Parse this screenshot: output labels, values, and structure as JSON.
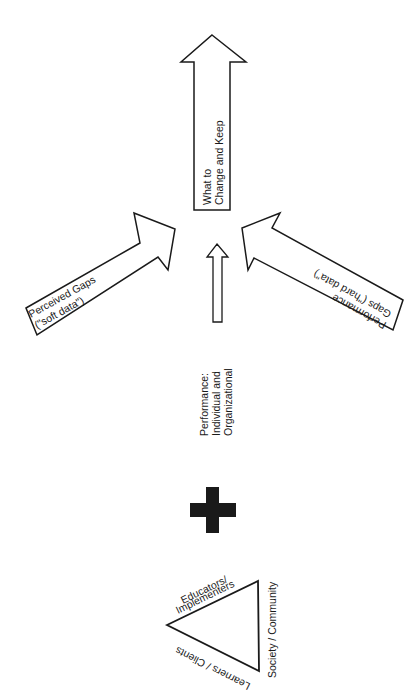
{
  "diagram": {
    "top_arrow": {
      "line1": "What to",
      "line2": "Change and Keep"
    },
    "left_arrow": {
      "line1": "Perceived Gaps",
      "line2": "(\"soft data\")"
    },
    "right_arrow": {
      "line1": "Performance",
      "line2": "Gaps (\"hard data\")"
    },
    "center_label": {
      "line1": "Performance:",
      "line2": "Individual  and",
      "line3": "Organizational"
    },
    "plus_symbol": "+",
    "triangle": {
      "top_side_line1": "Educators/",
      "top_side_line2": "Implementers",
      "right_side": "Society / Community",
      "bottom_side": "Learners / Clients"
    }
  },
  "colors": {
    "stroke": "#1a1a1a",
    "fill": "#ffffff",
    "plus": "#1a1a1a"
  }
}
